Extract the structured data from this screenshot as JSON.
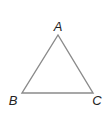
{
  "diagram": {
    "type": "triangle",
    "vertices": [
      {
        "label": "A"
      },
      {
        "label": "B"
      },
      {
        "label": "C"
      }
    ],
    "stroke_color": "#8a8a8a",
    "label_color": "#222222"
  }
}
